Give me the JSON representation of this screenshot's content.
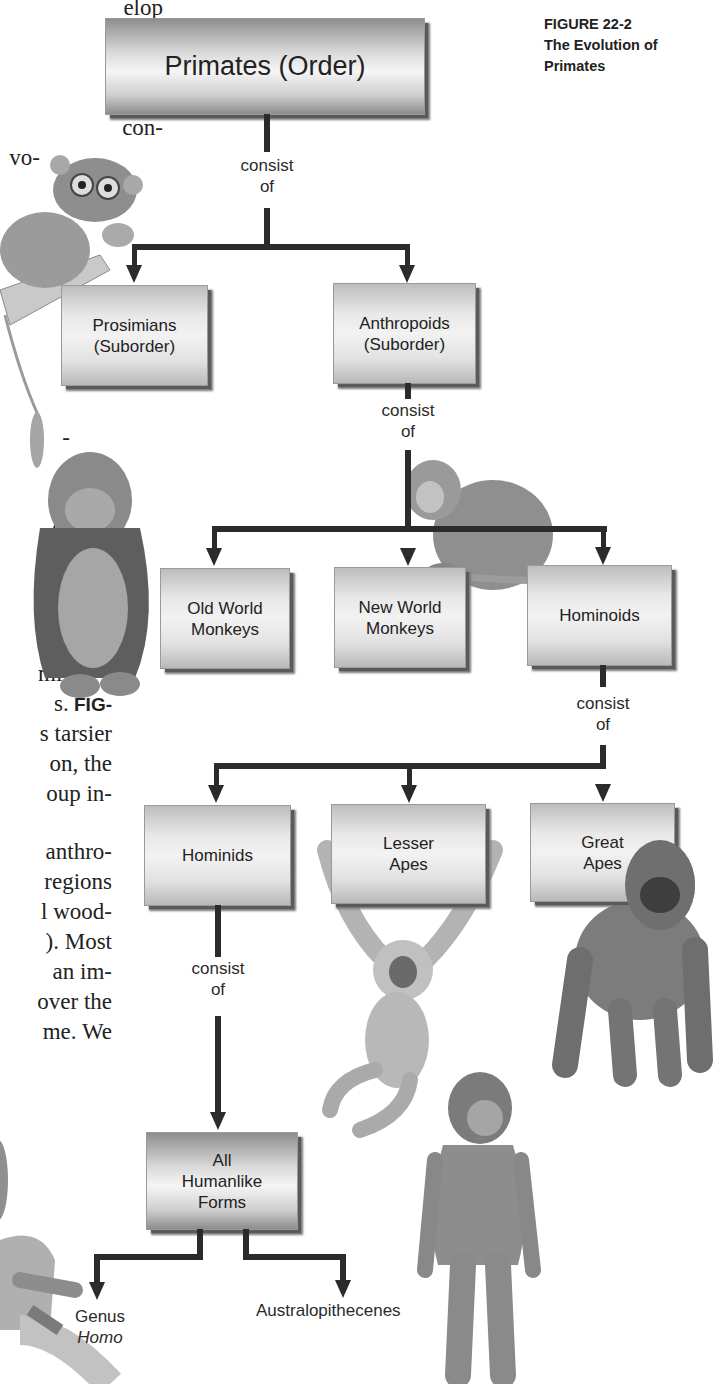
{
  "caption": {
    "figure_number": "FIGURE 22-2",
    "title": "The Evolution of Primates"
  },
  "body_text_fragments": [
    {
      "text": "elop",
      "top": -6
    },
    {
      "text": "mam-",
      "top": 24
    },
    {
      "text": "uman",
      "top": 54
    },
    {
      "text": "ortant",
      "top": 84
    },
    {
      "text": "con-",
      "top": 114
    },
    {
      "text": "vo-",
      "top": 144
    },
    {
      "text": "-",
      "top": 424
    },
    {
      "text": "e",
      "top": 454
    },
    {
      "text": "or",
      "top": 484
    },
    {
      "text": "e-",
      "top": 514
    },
    {
      "text": "-",
      "top": 544
    },
    {
      "text": "2",
      "top": 574,
      "bold": true
    },
    {
      "text": "es",
      "top": 630
    },
    {
      "text": "mi-",
      "top": 660
    },
    {
      "text": "s.",
      "top": 690,
      "suffix_bold": "FIG-"
    },
    {
      "text": "s tarsier",
      "top": 720
    },
    {
      "text": "on, the",
      "top": 750
    },
    {
      "text": "oup in-",
      "top": 780
    },
    {
      "text": "anthro-",
      "top": 838
    },
    {
      "text": "regions",
      "top": 868
    },
    {
      "text": "l wood-",
      "top": 898
    },
    {
      "text": "). Most",
      "top": 928
    },
    {
      "text": "an im-",
      "top": 958
    },
    {
      "text": "over the",
      "top": 988
    },
    {
      "text": "me. We",
      "top": 1018
    }
  ],
  "diagram": {
    "connector_label": "consist of",
    "connector_line1": "consist",
    "connector_line2": "of",
    "nodes": {
      "primates": {
        "label": "Primates (Order)"
      },
      "prosimians": {
        "line1": "Prosimians",
        "line2": "(Suborder)"
      },
      "anthropoids": {
        "line1": "Anthropoids",
        "line2": "(Suborder)"
      },
      "old_world": {
        "line1": "Old World",
        "line2": "Monkeys"
      },
      "new_world": {
        "line1": "New World",
        "line2": "Monkeys"
      },
      "hominoids": {
        "label": "Hominoids"
      },
      "hominids": {
        "label": "Hominids"
      },
      "lesser_apes": {
        "line1": "Lesser",
        "line2": "Apes"
      },
      "great_apes": {
        "line1": "Great",
        "line2": "Apes"
      },
      "humanlike": {
        "line1": "All",
        "line2": "Humanlike",
        "line3": "Forms"
      }
    },
    "leaves": {
      "genus": {
        "line1": "Genus",
        "line2": "Homo"
      },
      "australopithecenes": {
        "label": "Australopithecenes"
      }
    },
    "edges": [
      [
        "Primates (Order)",
        "Prosimians (Suborder)"
      ],
      [
        "Primates (Order)",
        "Anthropoids (Suborder)"
      ],
      [
        "Anthropoids (Suborder)",
        "Old World Monkeys"
      ],
      [
        "Anthropoids (Suborder)",
        "New World Monkeys"
      ],
      [
        "Anthropoids (Suborder)",
        "Hominoids"
      ],
      [
        "Hominoids",
        "Hominids"
      ],
      [
        "Hominoids",
        "Lesser Apes"
      ],
      [
        "Hominoids",
        "Great Apes"
      ],
      [
        "Hominids",
        "All Humanlike Forms"
      ],
      [
        "All Humanlike Forms",
        "Genus Homo"
      ],
      [
        "All Humanlike Forms",
        "Australopithecenes"
      ]
    ]
  },
  "illustrations": [
    "tarsier",
    "orangutan",
    "new-world-monkey",
    "gibbon",
    "gorilla",
    "australopithecine",
    "seated-human"
  ]
}
